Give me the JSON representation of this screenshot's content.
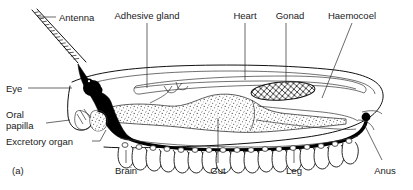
{
  "figure": {
    "panel_label": "(a)",
    "background_color": "#ffffff",
    "ink_color": "#111111"
  },
  "labels": {
    "antenna": "Antenna",
    "adhesive_gland": "Adhesive gland",
    "heart": "Heart",
    "gonad": "Gonad",
    "haemocoel": "Haemocoel",
    "eye": "Eye",
    "oral_papilla_line1": "Oral",
    "oral_papilla_line2": "papilla",
    "excretory_organ": "Excretory organ",
    "brain": "Brain",
    "gut": "Gut",
    "leg": "Leg",
    "anus": "Anus"
  },
  "structures": [
    {
      "name": "antenna",
      "style": "segmented-ladder"
    },
    {
      "name": "eye",
      "style": "solid-black-dot"
    },
    {
      "name": "brain",
      "style": "solid-black-mass"
    },
    {
      "name": "oral-papilla",
      "style": "outline-lobe"
    },
    {
      "name": "excretory-organ",
      "style": "outline-lobe"
    },
    {
      "name": "adhesive-gland",
      "style": "branched-squiggle"
    },
    {
      "name": "heart",
      "style": "dorsal-tube"
    },
    {
      "name": "gonad",
      "style": "cross-hatched-ellipse"
    },
    {
      "name": "gut",
      "style": "stippled-mass"
    },
    {
      "name": "haemocoel",
      "style": "body-cavity"
    },
    {
      "name": "leg",
      "style": "u-shaped-lobe-row",
      "count": 17
    },
    {
      "name": "nerve-cord",
      "style": "thick-black-line"
    },
    {
      "name": "anus",
      "style": "posterior-opening"
    }
  ]
}
